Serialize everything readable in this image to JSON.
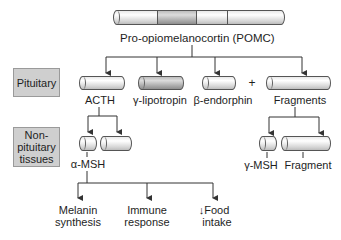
{
  "title": "Pro-opiomelanocortin (POMC)",
  "regions": {
    "pituitary": "Pituitary",
    "nonpituitary_line1": "Non-",
    "nonpituitary_line2": "pituitary",
    "nonpituitary_line3": "tissues"
  },
  "pituitary_products": {
    "acth": "ACTH",
    "gamma_lipotropin": "γ-lipotropin",
    "beta_endorphin": "β-endorphin",
    "plus": "+",
    "fragments": "Fragments"
  },
  "nonpituitary_products": {
    "alpha_msh": "α-MSH",
    "gamma_msh": "γ-MSH",
    "fragment": "Fragment"
  },
  "effects": {
    "melanin_line1": "Melanin",
    "melanin_line2": "synthesis",
    "immune_line1": "Immune",
    "immune_line2": "response",
    "food_line1": "Food",
    "food_line2": "intake",
    "food_arrow": "↓"
  },
  "colors": {
    "box_fill": "#cfcfcf",
    "line": "#333333",
    "cylinder_light": "#e9e9e9",
    "cylinder_dark": "#a9a9a9"
  }
}
